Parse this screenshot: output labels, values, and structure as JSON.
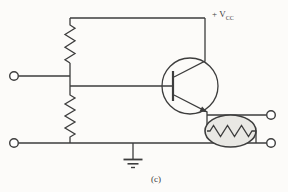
{
  "figure": {
    "type": "circuit-schematic",
    "caption": "(c)"
  },
  "labels": {
    "supply_prefix": "+ V",
    "supply_subscript": "CC"
  },
  "colors": {
    "background": "#fcfbf9",
    "line": "#3d3d3d",
    "load_fill": "#e9e8e4",
    "terminal_fill": "#ffffff"
  },
  "components": {
    "input_terminal_top": "upper input terminal",
    "input_terminal_bottom": "lower input terminal",
    "output_terminal_top": "upper output terminal",
    "output_terminal_bottom": "lower output terminal",
    "bias_resistor_upper": "upper bias resistor (to +VCC)",
    "bias_resistor_lower": "lower bias resistor (to ground rail)",
    "transistor": "NPN bipolar transistor",
    "load": "resistive load enclosed in oval (output device)",
    "ground": "earth ground symbol",
    "supply_rail": "+VCC supply rail"
  }
}
